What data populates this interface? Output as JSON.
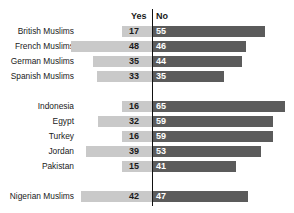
{
  "chart_data": {
    "type": "bar",
    "title": "",
    "subtitle": "",
    "xlabel": "",
    "ylabel": "",
    "orientation": "horizontal",
    "layout": "diverging-bidirectional",
    "grid": false,
    "legend_position": "top-center",
    "axis_center_value": 0,
    "value_unit": "percent",
    "colors": {
      "yes": "#c9c9c9",
      "no": "#5b5b5b",
      "axis": "#111111",
      "text": "#1a1a1a",
      "value_on_dark": "#ffffff",
      "background": "#ffffff"
    },
    "columns": [
      "Yes",
      "No"
    ],
    "categories": [
      "British Muslims",
      "French Muslims",
      "German Muslims",
      "Spanish Muslims",
      "Indonesia",
      "Egypt",
      "Turkey",
      "Jordan",
      "Pakistan",
      "Nigerian Muslims"
    ],
    "series": [
      {
        "name": "Yes",
        "direction": "left",
        "values": [
          17,
          48,
          35,
          33,
          16,
          32,
          16,
          39,
          15,
          42
        ]
      },
      {
        "name": "No",
        "direction": "right",
        "values": [
          55,
          46,
          44,
          35,
          65,
          59,
          59,
          53,
          41,
          47
        ]
      }
    ],
    "groups": [
      {
        "name": "european-muslims",
        "rows": [
          0,
          1,
          2,
          3
        ]
      },
      {
        "name": "muslim-majority-countries",
        "rows": [
          4,
          5,
          6,
          7,
          8
        ]
      },
      {
        "name": "nigerian-muslims",
        "rows": [
          9
        ]
      }
    ],
    "rows": [
      {
        "label": "British Muslims",
        "yes": 17,
        "no": 55,
        "group": 0
      },
      {
        "label": "French Muslims",
        "yes": 48,
        "no": 46,
        "group": 0
      },
      {
        "label": "German Muslims",
        "yes": 35,
        "no": 44,
        "group": 0
      },
      {
        "label": "Spanish Muslims",
        "yes": 33,
        "no": 35,
        "group": 0
      },
      {
        "label": "Indonesia",
        "yes": 16,
        "no": 65,
        "group": 1
      },
      {
        "label": "Egypt",
        "yes": 32,
        "no": 59,
        "group": 1
      },
      {
        "label": "Turkey",
        "yes": 16,
        "no": 59,
        "group": 1
      },
      {
        "label": "Jordan",
        "yes": 39,
        "no": 53,
        "group": 1
      },
      {
        "label": "Pakistan",
        "yes": 15,
        "no": 41,
        "group": 1
      },
      {
        "label": "Nigerian Muslims",
        "yes": 42,
        "no": 47,
        "group": 2
      }
    ]
  },
  "header": {
    "yes_label": "Yes",
    "no_label": "No"
  }
}
